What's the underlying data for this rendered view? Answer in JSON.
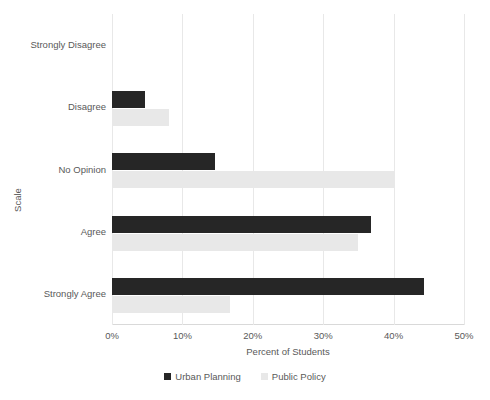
{
  "chart_data": {
    "type": "bar",
    "orientation": "horizontal",
    "title": "",
    "xlabel": "Percent of Students",
    "ylabel": "Scale",
    "categories": [
      "Strongly Disagree",
      "Disagree",
      "No Opinion",
      "Agree",
      "Strongly Agree"
    ],
    "series": [
      {
        "name": "Urban Planning",
        "color": "#262626",
        "values": [
          0,
          4.7,
          14.7,
          36.8,
          44.3
        ]
      },
      {
        "name": "Public Policy",
        "color": "#e8e8e8",
        "values": [
          0,
          8.1,
          40.0,
          34.9,
          16.8
        ]
      }
    ],
    "xlim": [
      0,
      50
    ],
    "xticks": [
      0,
      10,
      20,
      30,
      40,
      50
    ],
    "xtick_labels": [
      "0%",
      "10%",
      "20%",
      "30%",
      "40%",
      "50%"
    ],
    "grid": "vertical",
    "legend_position": "bottom"
  }
}
